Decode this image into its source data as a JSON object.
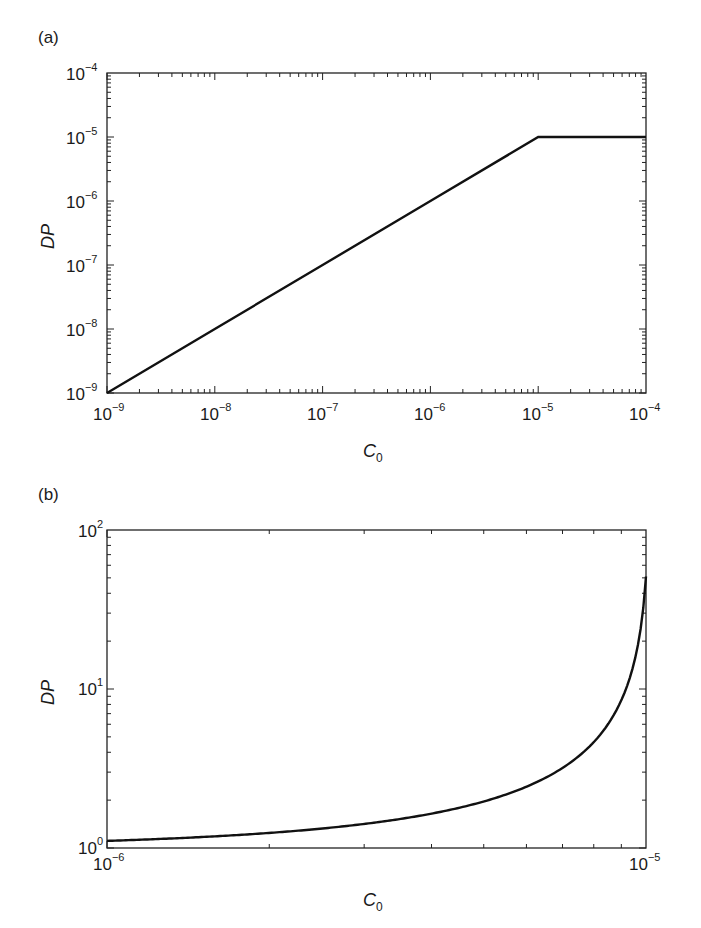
{
  "chart_data": [
    {
      "panel": "(a)",
      "type": "line",
      "xscale": "log",
      "yscale": "log",
      "xlabel": "C0",
      "ylabel": "DP",
      "xlim": [
        1e-09,
        0.0001
      ],
      "ylim": [
        1e-09,
        0.0001
      ],
      "xticks": [
        "10^-9",
        "10^-8",
        "10^-7",
        "10^-6",
        "10^-5",
        "10^-4"
      ],
      "yticks": [
        "10^-9",
        "10^-8",
        "10^-7",
        "10^-6",
        "10^-5",
        "10^-4"
      ],
      "series": [
        {
          "name": "DP",
          "x": [
            1e-09,
            1e-08,
            1e-07,
            1e-06,
            1e-05,
            0.0001
          ],
          "y": [
            1e-09,
            1e-08,
            1e-07,
            1e-06,
            1e-05,
            1e-05
          ]
        }
      ],
      "grid": false
    },
    {
      "panel": "(b)",
      "type": "line",
      "xscale": "log",
      "yscale": "log",
      "xlabel": "C0",
      "ylabel": "DP",
      "xlim": [
        1e-06,
        1e-05
      ],
      "ylim": [
        1,
        100
      ],
      "xticks": [
        "10^-6",
        "10^-5"
      ],
      "yticks": [
        "10^0",
        "10^1",
        "10^2"
      ],
      "series": [
        {
          "name": "DP",
          "x": [
            1e-06,
            2e-06,
            3e-06,
            4e-06,
            5e-06,
            6e-06,
            7e-06,
            8e-06,
            9e-06,
            9.5e-06,
            1e-05
          ],
          "y": [
            1.1,
            1.24,
            1.42,
            1.64,
            1.96,
            2.42,
            3.2,
            4.7,
            8.9,
            14.5,
            46
          ]
        }
      ],
      "grid": false
    }
  ],
  "panels": {
    "a": {
      "label": "(a)",
      "ylabel": "DP",
      "xlabel_main": "C",
      "xlabel_sub": "0",
      "xticks": [
        {
          "base": "10",
          "exp": "−9"
        },
        {
          "base": "10",
          "exp": "−8"
        },
        {
          "base": "10",
          "exp": "−7"
        },
        {
          "base": "10",
          "exp": "−6"
        },
        {
          "base": "10",
          "exp": "−5"
        },
        {
          "base": "10",
          "exp": "−4"
        }
      ],
      "yticks": [
        {
          "base": "10",
          "exp": "−4"
        },
        {
          "base": "10",
          "exp": "−5"
        },
        {
          "base": "10",
          "exp": "−6"
        },
        {
          "base": "10",
          "exp": "−7"
        },
        {
          "base": "10",
          "exp": "−8"
        },
        {
          "base": "10",
          "exp": "−9"
        }
      ]
    },
    "b": {
      "label": "(b)",
      "ylabel": "DP",
      "xlabel_main": "C",
      "xlabel_sub": "0",
      "xticks": [
        {
          "base": "10",
          "exp": "−6"
        },
        {
          "base": "10",
          "exp": "−5"
        }
      ],
      "yticks": [
        {
          "base": "10",
          "exp": "2"
        },
        {
          "base": "10",
          "exp": "1"
        },
        {
          "base": "10",
          "exp": "0"
        }
      ]
    }
  },
  "colors": {
    "line": "#111111",
    "axis": "#222222",
    "background": "#ffffff"
  }
}
